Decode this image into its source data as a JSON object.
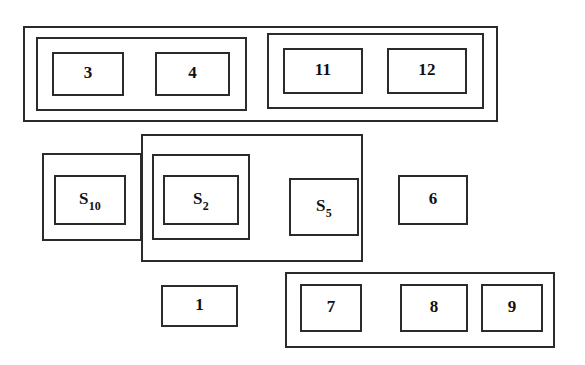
{
  "diagram": {
    "type": "nested-box-grouping-diagram",
    "canvas": {
      "width": 585,
      "height": 365,
      "background": "#ffffff"
    },
    "colors": {
      "line": "#2b2b2b",
      "text": "#111111",
      "background": "#ffffff"
    },
    "groups": [
      {
        "id": "top-outer-group",
        "name": "top-outer-group",
        "label": "",
        "rect": {
          "x": 23,
          "y": 26,
          "w": 475,
          "h": 96
        },
        "children": [
          "top-left-subgroup",
          "top-right-subgroup"
        ]
      },
      {
        "id": "top-left-subgroup",
        "name": "top-left-subgroup",
        "label": "",
        "rect": {
          "x": 36,
          "y": 37,
          "w": 211,
          "h": 74
        },
        "children": [
          "box-3",
          "box-4"
        ]
      },
      {
        "id": "top-right-subgroup",
        "name": "top-right-subgroup",
        "label": "",
        "rect": {
          "x": 267,
          "y": 33,
          "w": 217,
          "h": 76
        },
        "children": [
          "box-11",
          "box-12"
        ]
      },
      {
        "id": "middle-left-group",
        "name": "middle-left-group",
        "label": "",
        "rect": {
          "x": 42,
          "y": 153,
          "w": 100,
          "h": 88
        },
        "children": [
          "box-s10"
        ]
      },
      {
        "id": "middle-large-group",
        "name": "middle-large-group",
        "label": "",
        "rect": {
          "x": 141,
          "y": 134,
          "w": 222,
          "h": 128
        },
        "children": [
          "middle-inner-group",
          "box-s5"
        ]
      },
      {
        "id": "middle-inner-group",
        "name": "middle-inner-group",
        "label": "",
        "rect": {
          "x": 152,
          "y": 154,
          "w": 98,
          "h": 86
        },
        "children": [
          "box-s2"
        ]
      },
      {
        "id": "bottom-right-group",
        "name": "bottom-right-group",
        "label": "",
        "rect": {
          "x": 285,
          "y": 272,
          "w": 270,
          "h": 76
        },
        "children": [
          "box-7",
          "box-8",
          "box-9"
        ]
      }
    ],
    "leaves": [
      {
        "id": "box-3",
        "name": "box-3",
        "label": "3",
        "sub": "",
        "rect": {
          "x": 52,
          "y": 52,
          "w": 72,
          "h": 44
        }
      },
      {
        "id": "box-4",
        "name": "box-4",
        "label": "4",
        "sub": "",
        "rect": {
          "x": 155,
          "y": 52,
          "w": 75,
          "h": 44
        }
      },
      {
        "id": "box-11",
        "name": "box-11",
        "label": "11",
        "sub": "",
        "rect": {
          "x": 283,
          "y": 48,
          "w": 80,
          "h": 46
        }
      },
      {
        "id": "box-12",
        "name": "box-12",
        "label": "12",
        "sub": "",
        "rect": {
          "x": 387,
          "y": 48,
          "w": 80,
          "h": 46
        }
      },
      {
        "id": "box-s10",
        "name": "box-s10",
        "label": "S",
        "sub": "10",
        "rect": {
          "x": 54,
          "y": 175,
          "w": 72,
          "h": 50
        }
      },
      {
        "id": "box-s2",
        "name": "box-s2",
        "label": "S",
        "sub": "2",
        "rect": {
          "x": 163,
          "y": 175,
          "w": 76,
          "h": 50
        }
      },
      {
        "id": "box-s5",
        "name": "box-s5",
        "label": "S",
        "sub": "5",
        "rect": {
          "x": 289,
          "y": 178,
          "w": 70,
          "h": 58
        }
      },
      {
        "id": "box-6",
        "name": "box-6",
        "label": "6",
        "sub": "",
        "rect": {
          "x": 398,
          "y": 175,
          "w": 70,
          "h": 50
        }
      },
      {
        "id": "box-1",
        "name": "box-1",
        "label": "1",
        "sub": "",
        "rect": {
          "x": 161,
          "y": 285,
          "w": 77,
          "h": 42
        }
      },
      {
        "id": "box-7",
        "name": "box-7",
        "label": "7",
        "sub": "",
        "rect": {
          "x": 300,
          "y": 284,
          "w": 62,
          "h": 48
        }
      },
      {
        "id": "box-8",
        "name": "box-8",
        "label": "8",
        "sub": "",
        "rect": {
          "x": 400,
          "y": 284,
          "w": 68,
          "h": 48
        }
      },
      {
        "id": "box-9",
        "name": "box-9",
        "label": "9",
        "sub": "",
        "rect": {
          "x": 481,
          "y": 284,
          "w": 62,
          "h": 48
        }
      }
    ]
  }
}
